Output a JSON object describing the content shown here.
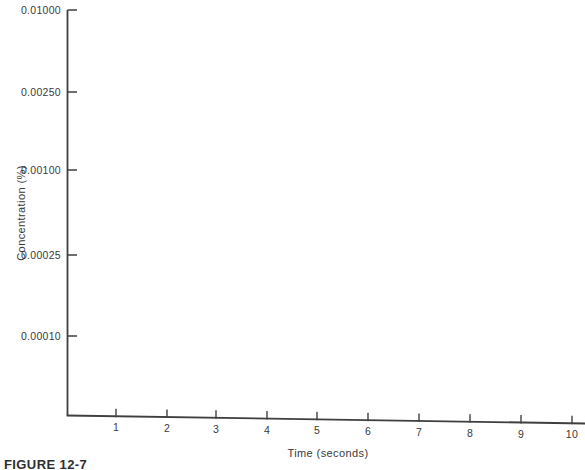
{
  "figure": {
    "caption": "FIGURE 12-7"
  },
  "chart_data": {
    "type": "line",
    "title": "",
    "xlabel": "Time (seconds)",
    "ylabel": "Concentration (%)",
    "x_ticks": [
      "1",
      "2",
      "3",
      "4",
      "5",
      "6",
      "7",
      "8",
      "9",
      "10"
    ],
    "y_ticks": [
      "0.01000",
      "0.00250",
      "0.00100",
      "0.00025",
      "0.00010"
    ],
    "x_range": [
      0,
      10.3
    ],
    "grid": "off",
    "legend": "none",
    "series": []
  },
  "colors": {
    "axis": "#3f3f3f",
    "background": "#ffffff"
  }
}
